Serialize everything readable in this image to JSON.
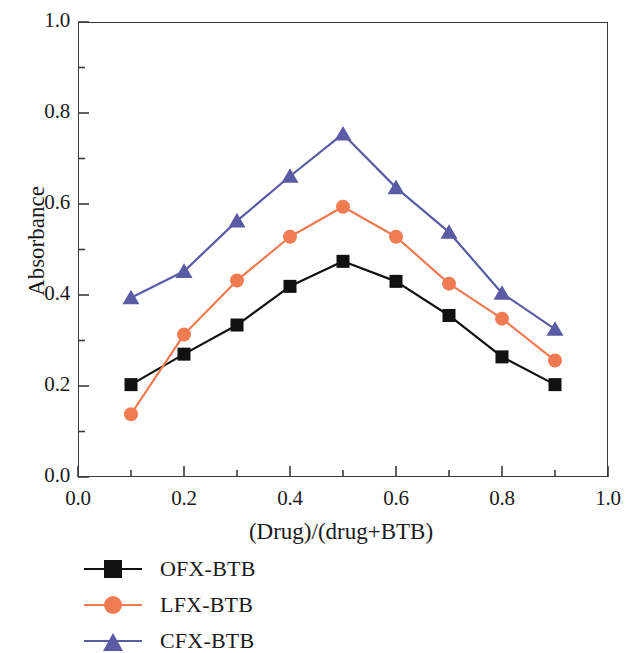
{
  "chart_data": {
    "type": "line",
    "title": "",
    "xlabel": "(Drug)/(drug+BTB)",
    "ylabel": "Absorbance",
    "xlim": [
      0.0,
      1.0
    ],
    "ylim": [
      0.0,
      1.0
    ],
    "xticks": [
      "0.0",
      "0.2",
      "0.4",
      "0.6",
      "0.8",
      "1.0"
    ],
    "xtick_values": [
      0.0,
      0.2,
      0.4,
      0.6,
      0.8,
      1.0
    ],
    "yticks": [
      "0.0",
      "0.2",
      "0.4",
      "0.6",
      "0.8",
      "1.0"
    ],
    "ytick_values": [
      0.0,
      0.2,
      0.4,
      0.6,
      0.8,
      1.0
    ],
    "minor_tick_step": 0.1,
    "grid": false,
    "legend_position": "below-left",
    "x": [
      0.1,
      0.2,
      0.3,
      0.4,
      0.5,
      0.6,
      0.7,
      0.8,
      0.9
    ],
    "series": [
      {
        "name": "OFX-BTB",
        "color": "#111111",
        "marker": "square",
        "values": [
          0.203,
          0.27,
          0.334,
          0.419,
          0.474,
          0.43,
          0.355,
          0.264,
          0.203
        ]
      },
      {
        "name": "LFX-BTB",
        "color": "#ef7b52",
        "marker": "circle",
        "values": [
          0.138,
          0.313,
          0.432,
          0.528,
          0.594,
          0.528,
          0.425,
          0.348,
          0.256
        ]
      },
      {
        "name": "CFX-BTB",
        "color": "#5b5ba5",
        "marker": "triangle",
        "values": [
          0.394,
          0.452,
          0.563,
          0.661,
          0.754,
          0.636,
          0.538,
          0.404,
          0.325
        ]
      }
    ]
  },
  "legend": {
    "items": [
      {
        "label": "OFX-BTB"
      },
      {
        "label": "LFX-BTB"
      },
      {
        "label": "CFX-BTB"
      }
    ]
  },
  "axes": {
    "x_title": "(Drug)/(drug+BTB)",
    "y_title": "Absorbance"
  }
}
